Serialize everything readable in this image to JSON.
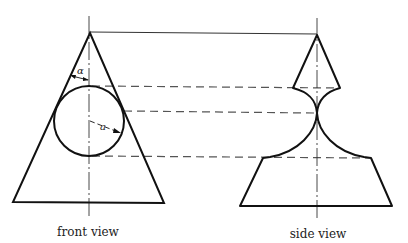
{
  "diagram": {
    "front_view": {
      "caption": "front view",
      "angle_symbol": "α",
      "radius_symbol": "a"
    },
    "side_view": {
      "caption": "side view"
    },
    "colors": {
      "outline": "#111111",
      "projection": "#555555",
      "centerline": "#333333"
    }
  }
}
